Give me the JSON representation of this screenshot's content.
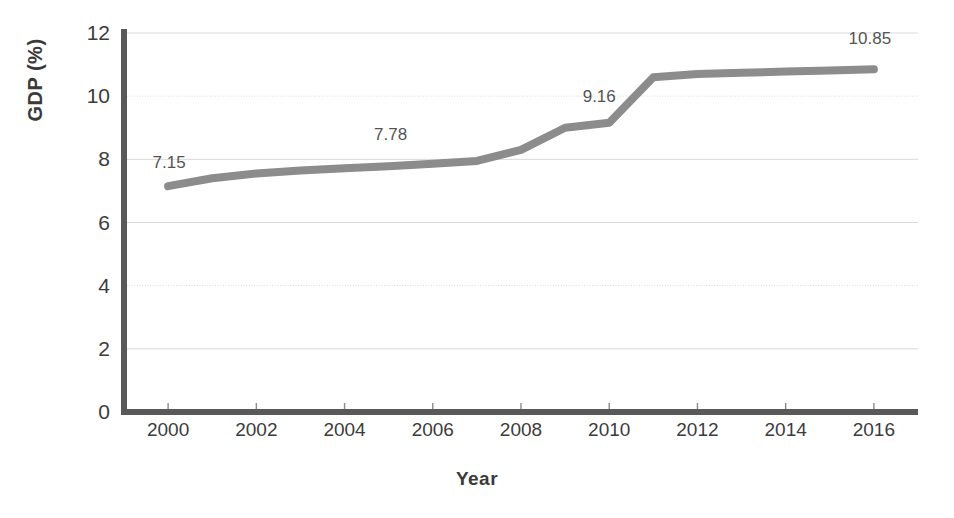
{
  "chart_data": {
    "type": "line",
    "title": "",
    "xlabel": "Year",
    "ylabel": "GDP (%)",
    "xlim": [
      1999,
      2017
    ],
    "ylim": [
      0,
      12
    ],
    "xticks": [
      "2000",
      "2002",
      "2004",
      "2006",
      "2008",
      "2010",
      "2012",
      "2014",
      "2016"
    ],
    "xtick_values": [
      2000,
      2002,
      2004,
      2006,
      2008,
      2010,
      2012,
      2014,
      2016
    ],
    "yticks": [
      "0",
      "2",
      "4",
      "6",
      "8",
      "10",
      "12"
    ],
    "ytick_values": [
      0,
      2,
      4,
      6,
      8,
      10,
      12
    ],
    "grid": true,
    "legend": "none",
    "line_color": "#8c8c8c",
    "axis_color": "#595959",
    "grid_color": "#d9d9d9",
    "x": [
      2000,
      2001,
      2002,
      2003,
      2004,
      2005,
      2006,
      2007,
      2008,
      2009,
      2010,
      2011,
      2012,
      2013,
      2014,
      2015,
      2016
    ],
    "values": [
      7.15,
      7.4,
      7.55,
      7.65,
      7.72,
      7.78,
      7.86,
      7.95,
      8.3,
      9.0,
      9.16,
      10.6,
      10.7,
      10.74,
      10.78,
      10.81,
      10.85
    ],
    "annotations": [
      {
        "label": "7.15",
        "x": 2000,
        "y": 7.15
      },
      {
        "label": "7.78",
        "x": 2005,
        "y": 7.78
      },
      {
        "label": "9.16",
        "x": 2010,
        "y": 9.16
      },
      {
        "label": "10.85",
        "x": 2016,
        "y": 10.85
      }
    ]
  }
}
